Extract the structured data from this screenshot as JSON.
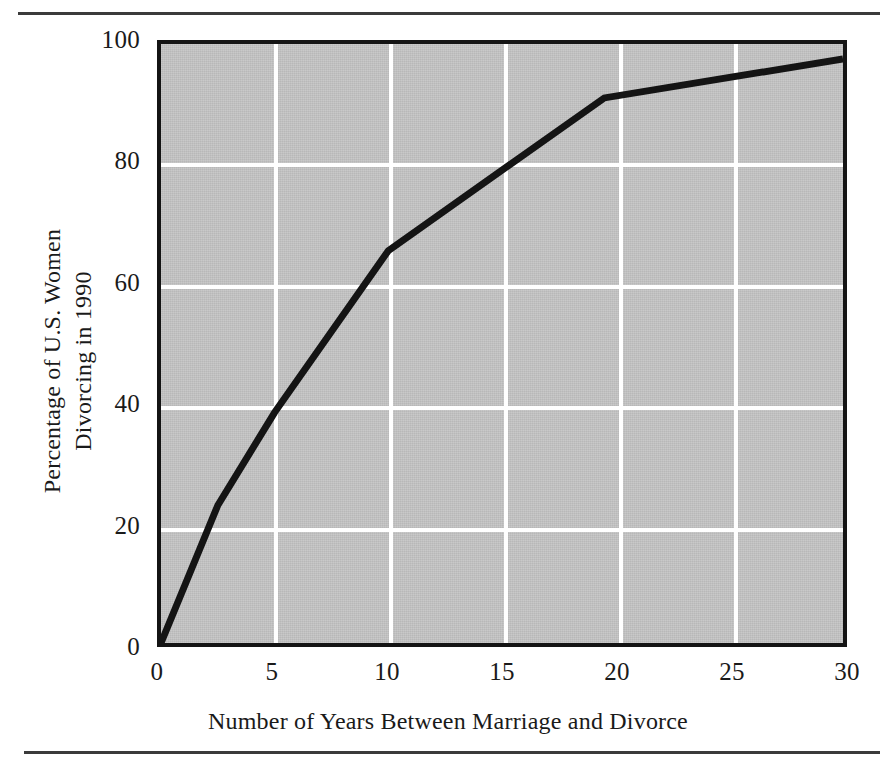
{
  "figure": {
    "top_rule": "horizontal-rule",
    "bottom_rule": "horizontal-rule"
  },
  "chart_data": {
    "type": "line",
    "title": "",
    "xlabel": "Number of Years Between Marriage and Divorce",
    "ylabel_line1": "Percentage of U.S. Women",
    "ylabel_line2": "Divorcing in 1990",
    "xlim": [
      0,
      30
    ],
    "ylim": [
      0,
      100
    ],
    "xticks": [
      0,
      5,
      10,
      15,
      20,
      25,
      30
    ],
    "xtick_labels": [
      "0",
      "5",
      "10",
      "15",
      "20",
      "25",
      "30"
    ],
    "yticks": [
      0,
      20,
      40,
      60,
      80,
      100
    ],
    "ytick_labels": [
      "0",
      "20",
      "40",
      "60",
      "80",
      "100"
    ],
    "grid": {
      "vertical_at": [
        5,
        10,
        15,
        20,
        25
      ],
      "horizontal_at": [
        20,
        40,
        60,
        80
      ],
      "color": "#ffffff"
    },
    "legend": null,
    "series": [
      {
        "name": "Cumulative percentage of divorces",
        "color": "#141414",
        "linewidth": 7,
        "x": [
          0,
          2.5,
          5,
          10,
          19.5,
          30
        ],
        "y": [
          0,
          23,
          38.5,
          65.5,
          91,
          97.5
        ]
      }
    ],
    "plot_background": "#c3c3c3",
    "border_color": "#141414"
  }
}
